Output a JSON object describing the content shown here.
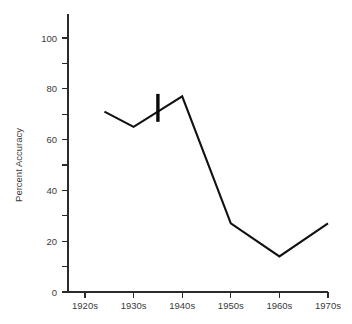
{
  "chart_data": {
    "type": "line",
    "title": "",
    "xlabel": "",
    "ylabel": "Percent Accuracy",
    "ylim": [
      0,
      110
    ],
    "xlim": [
      1915,
      1975
    ],
    "grid": false,
    "legend": "none",
    "categories": [
      "1920s",
      "1930s",
      "1940s",
      "1950s",
      "1960s",
      "1970s"
    ],
    "x": [
      1924,
      1930,
      1940,
      1950,
      1960,
      1970
    ],
    "values": [
      71,
      65,
      77,
      27,
      14,
      27
    ],
    "series": [
      {
        "name": "Percent Accuracy",
        "values": [
          71,
          65,
          77,
          27,
          14,
          27
        ],
        "color": "#111111"
      }
    ],
    "y_ticks_major": [
      0,
      20,
      40,
      60,
      80,
      100
    ],
    "y_tick_labels": [
      "0",
      "20",
      "40",
      "60",
      "80",
      "100"
    ],
    "y_ticks_minor": [
      10,
      30,
      50,
      70,
      90
    ],
    "x_ticks": [
      1920,
      1930,
      1940,
      1950,
      1960,
      1970
    ],
    "x_tick_labels": [
      "1920s",
      "1930s",
      "1940s",
      "1950s",
      "1960s",
      "1970s"
    ],
    "annotations": [
      {
        "name": "error-bar-marker",
        "x": 1935,
        "y_low": 67,
        "y_high": 78,
        "color": "#0a0a0a"
      }
    ]
  },
  "axis": {
    "y_title": "Percent Accuracy",
    "y_labels": {
      "t100": "100",
      "t80": "80",
      "t60": "60",
      "t40": "40",
      "t20": "20",
      "t0": "0"
    },
    "x_labels": {
      "d1920": "1920s",
      "d1930": "1930s",
      "d1940": "1940s",
      "d1950": "1950s",
      "d1960": "1960s",
      "d1970": "1970s"
    }
  }
}
